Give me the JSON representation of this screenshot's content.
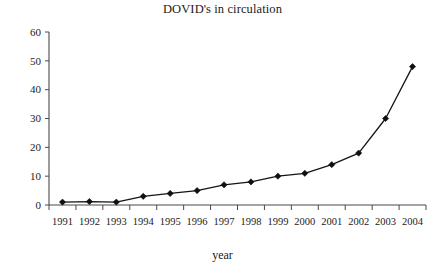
{
  "chart_data": {
    "type": "line",
    "title": "DOVID's in circulation",
    "xlabel": "year",
    "ylabel": "",
    "categories": [
      "1991",
      "1992",
      "1993",
      "1994",
      "1995",
      "1996",
      "1997",
      "1998",
      "1999",
      "2000",
      "2001",
      "2002",
      "2003",
      "2004"
    ],
    "values": [
      1,
      1.2,
      1,
      3,
      4,
      5,
      7,
      8,
      10,
      11,
      14,
      18,
      30,
      48
    ],
    "series": [
      {
        "name": "DOVID's in circulation",
        "values": [
          1,
          1.2,
          1,
          3,
          4,
          5,
          7,
          8,
          10,
          11,
          14,
          18,
          30,
          48
        ]
      }
    ],
    "ylim": [
      0,
      60
    ],
    "yticks": [
      "0",
      "10",
      "20",
      "30",
      "40",
      "50",
      "60"
    ],
    "ytick_values": [
      0,
      10,
      20,
      30,
      40,
      50,
      60
    ],
    "grid": false,
    "legend": "none",
    "marker": "diamond",
    "line_color": "#141414",
    "marker_color": "#101010",
    "axis_color": "#4a4a4a",
    "background": "#ffffff"
  }
}
